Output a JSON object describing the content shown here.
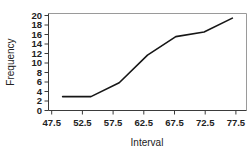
{
  "chart_data": {
    "type": "line",
    "title": "",
    "xlabel": "Interval",
    "ylabel": "Frequency",
    "x": [
      47.5,
      52.5,
      57.5,
      62.5,
      67.5,
      72.5,
      77.5
    ],
    "values": [
      3,
      3,
      6,
      12,
      16,
      17,
      20
    ],
    "series": [
      {
        "name": "Cumulative frequency",
        "values": [
          3,
          3,
          6,
          12,
          16,
          17,
          20
        ]
      }
    ],
    "xticklabels": [
      "47.5",
      "52.5",
      "57.5",
      "62.5",
      "67.5",
      "72.5",
      "77.5"
    ],
    "yticklabels": [
      "0",
      "2",
      "4",
      "6",
      "8",
      "10",
      "12",
      "14",
      "16",
      "18",
      "20"
    ],
    "yticks": [
      0,
      2,
      4,
      6,
      8,
      10,
      12,
      14,
      16,
      18,
      20
    ],
    "xlim": [
      45.0,
      80.0
    ],
    "ylim": [
      0,
      21
    ],
    "grid": false,
    "legend": false,
    "line_color": "#161616",
    "axis_color": "#3b3b3b",
    "border_color": "#9a9a9a"
  },
  "axis": {
    "x_title": "Interval",
    "y_title": "Frequency"
  },
  "ticks": {
    "x": [
      "47.5",
      "52.5",
      "57.5",
      "62.5",
      "67.5",
      "72.5",
      "77.5"
    ],
    "y": [
      "0",
      "2",
      "4",
      "6",
      "8",
      "10",
      "12",
      "14",
      "16",
      "18",
      "20"
    ]
  }
}
